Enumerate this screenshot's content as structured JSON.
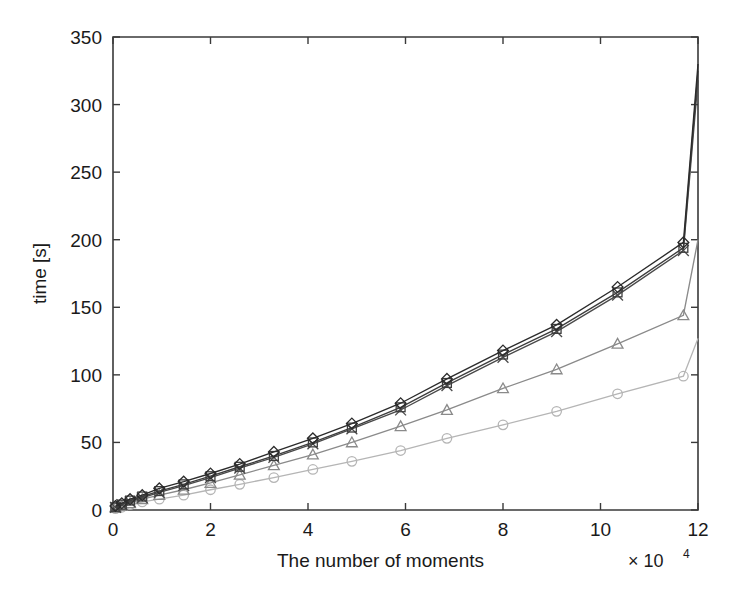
{
  "chart_data": {
    "type": "line",
    "title": "",
    "xlabel": "The number of moments",
    "ylabel": "time [s]",
    "x_multiplier": "× 10",
    "x_multiplier_exp": "4",
    "xlim": [
      0,
      12
    ],
    "ylim": [
      0,
      350
    ],
    "xticks": [
      0,
      2,
      4,
      6,
      8,
      10,
      12
    ],
    "xtick_labels": [
      "0",
      "2",
      "4",
      "6",
      "8",
      "10",
      "12"
    ],
    "yticks": [
      0,
      50,
      100,
      150,
      200,
      250,
      300,
      350
    ],
    "ytick_labels": [
      "0",
      "50",
      "100",
      "150",
      "200",
      "250",
      "300",
      "350"
    ],
    "grid": false,
    "legend": "none",
    "series": [
      {
        "name": "series-diamond",
        "marker": "diamond",
        "color": "#2b2b2b",
        "x": [
          0.05,
          0.18,
          0.35,
          0.6,
          0.95,
          1.45,
          2.0,
          2.6,
          3.3,
          4.1,
          4.9,
          5.9,
          6.85,
          8.0,
          9.1,
          10.35,
          11.7
        ],
        "y": [
          3,
          5,
          8,
          11,
          16,
          21,
          27,
          34,
          43,
          53,
          64,
          79,
          97,
          118,
          137,
          165,
          198
        ]
      },
      {
        "name": "series-square",
        "marker": "square",
        "color": "#3d3d3d",
        "x": [
          0.05,
          0.18,
          0.35,
          0.6,
          0.95,
          1.45,
          2.0,
          2.6,
          3.3,
          4.1,
          4.9,
          5.9,
          6.85,
          8.0,
          9.1,
          10.35,
          11.7
        ],
        "y": [
          2,
          4,
          7,
          10,
          14,
          19,
          25,
          32,
          40,
          50,
          61,
          76,
          94,
          115,
          134,
          161,
          194
        ]
      },
      {
        "name": "series-cross",
        "marker": "cross",
        "color": "#4a4a4a",
        "x": [
          0.05,
          0.18,
          0.35,
          0.6,
          0.95,
          1.45,
          2.0,
          2.6,
          3.3,
          4.1,
          4.9,
          5.9,
          6.85,
          8.0,
          9.1,
          10.35,
          11.7
        ],
        "y": [
          2,
          4,
          6,
          9,
          13,
          18,
          24,
          31,
          39,
          49,
          60,
          74,
          92,
          113,
          132,
          159,
          192
        ]
      },
      {
        "name": "series-triangle",
        "marker": "triangle",
        "color": "#8a8a8a",
        "x": [
          0.05,
          0.18,
          0.35,
          0.6,
          0.95,
          1.45,
          2.0,
          2.6,
          3.3,
          4.1,
          4.9,
          5.9,
          6.85,
          8.0,
          9.1,
          10.35,
          11.7
        ],
        "y": [
          2,
          3,
          5,
          8,
          11,
          15,
          20,
          26,
          33,
          41,
          50,
          62,
          74,
          90,
          104,
          123,
          144
        ]
      },
      {
        "name": "series-circle",
        "marker": "circle",
        "color": "#b5b5b5",
        "x": [
          0.05,
          0.18,
          0.35,
          0.6,
          0.95,
          1.45,
          2.0,
          2.6,
          3.3,
          4.1,
          4.9,
          5.9,
          6.85,
          8.0,
          9.1,
          10.35,
          11.7
        ],
        "y": [
          1,
          2,
          4,
          6,
          8,
          11,
          15,
          19,
          24,
          30,
          36,
          44,
          53,
          63,
          73,
          86,
          99
        ]
      }
    ],
    "series_tail": {
      "note_x": 12,
      "values": [
        330,
        325,
        318,
        200,
        127
      ]
    }
  }
}
